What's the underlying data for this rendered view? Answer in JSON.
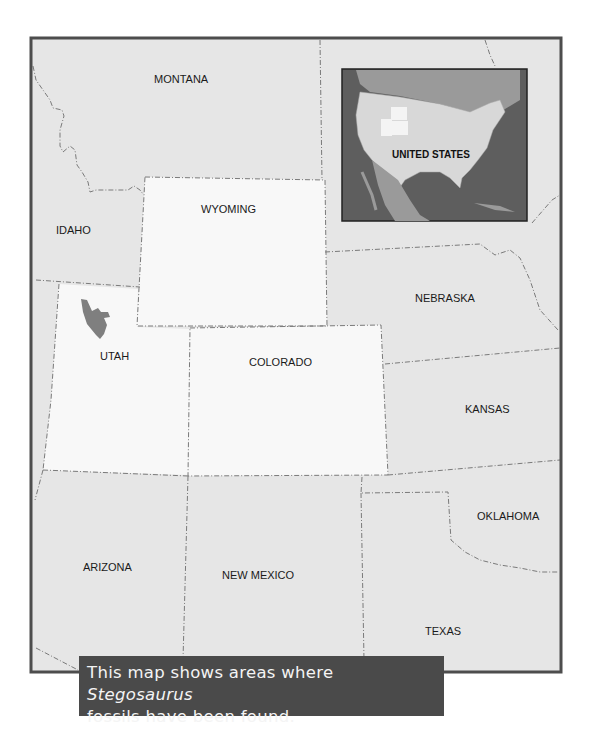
{
  "map": {
    "inset_label": "UNITED STATES",
    "states": [
      {
        "name": "MONTANA",
        "x": 154,
        "y": 83
      },
      {
        "name": "IDAHO",
        "x": 56,
        "y": 234
      },
      {
        "name": "WYOMING",
        "x": 201,
        "y": 213
      },
      {
        "name": "NEBRASKA",
        "x": 415,
        "y": 302
      },
      {
        "name": "UTAH",
        "x": 100,
        "y": 360
      },
      {
        "name": "COLORADO",
        "x": 249,
        "y": 366
      },
      {
        "name": "KANSAS",
        "x": 465,
        "y": 413
      },
      {
        "name": "OKLAHOMA",
        "x": 477,
        "y": 520
      },
      {
        "name": "ARIZONA",
        "x": 83,
        "y": 571
      },
      {
        "name": "NEW MEXICO",
        "x": 222,
        "y": 579
      },
      {
        "name": "TEXAS",
        "x": 425,
        "y": 635
      }
    ],
    "highlight_states": [
      "WYOMING",
      "UTAH",
      "COLORADO"
    ],
    "fossil_area_label": "Stegosaurus fossil area",
    "colors": {
      "frame": "#4d4d4d",
      "state_fill": "#e6e6e6",
      "highlight_fill": "#f8f8f8",
      "fossil_fill": "#7f7f7f",
      "inset_water": "#5e5e5e",
      "inset_land_other": "#9a9a9a",
      "inset_us": "#d8d8d8",
      "caption_bg": "#4a4a4a"
    }
  },
  "caption": {
    "line1_prefix": "This map shows areas where ",
    "line1_italic": "Stegosaurus",
    "line2": "fossils have been found."
  }
}
